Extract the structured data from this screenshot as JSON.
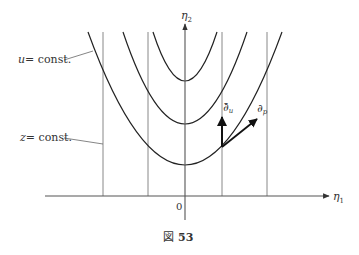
{
  "figure": {
    "caption_prefix": "図",
    "caption_number": "53"
  },
  "axes": {
    "x_label": "η",
    "x_subscript": "1",
    "y_label": "η",
    "y_subscript": "2",
    "origin_label": "0"
  },
  "annotations": {
    "u_const": {
      "var": "u",
      "text": "= const."
    },
    "z_const": {
      "var": "z",
      "text": "= const."
    }
  },
  "vectors": {
    "d_u": {
      "symbol": "∂̄",
      "subscript": "u"
    },
    "d_p": {
      "symbol": "∂",
      "subscript": "p"
    }
  },
  "colors": {
    "curve": "#222222",
    "vertical_line": "#777777",
    "axis": "#555555",
    "leader": "#666666",
    "arrow": "#222222"
  }
}
